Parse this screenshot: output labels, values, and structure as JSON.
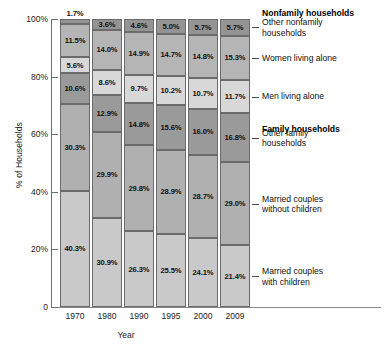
{
  "chart_data": {
    "type": "bar",
    "subtype": "100% stacked column",
    "title": "",
    "xlabel": "Year",
    "ylabel": "% of Households",
    "ylim": [
      0,
      100
    ],
    "ytick_labels": [
      "0",
      "20%",
      "40%",
      "60%",
      "80%",
      "100%"
    ],
    "ytick_values": [
      0,
      20,
      40,
      60,
      80,
      100
    ],
    "grid": false,
    "legend_position": "right-callouts",
    "categories": [
      "1970",
      "1980",
      "1990",
      "1995",
      "2000",
      "2009"
    ],
    "series": [
      {
        "name": "Married couples with children",
        "group": "Family households",
        "color": "#c9c9c9",
        "values": [
          40.3,
          30.9,
          26.3,
          25.5,
          24.1,
          21.4
        ],
        "labels": [
          "40.3%",
          "30.9%",
          "26.3%",
          "25.5%",
          "24.1%",
          "21.4%"
        ]
      },
      {
        "name": "Married couples without children",
        "group": "Family households",
        "color": "#b0b0b0",
        "values": [
          30.3,
          29.9,
          29.8,
          28.9,
          28.7,
          29.0
        ],
        "labels": [
          "30.3%",
          "29.9%",
          "29.8%",
          "28.9%",
          "28.7%",
          "29.0%"
        ]
      },
      {
        "name": "Other family households",
        "group": "Family households",
        "color": "#9a9a9a",
        "values": [
          10.6,
          12.9,
          14.8,
          15.6,
          16.0,
          16.8
        ],
        "labels": [
          "10.6%",
          "12.9%",
          "14.8%",
          "15.6%",
          "16.0%",
          "16.8%"
        ]
      },
      {
        "name": "Men living alone",
        "group": "Nonfamily households",
        "color": "#d8d8d8",
        "values": [
          5.6,
          8.6,
          9.7,
          10.2,
          10.7,
          11.7
        ],
        "labels": [
          "5.6%",
          "8.6%",
          "9.7%",
          "10.2%",
          "10.7%",
          "11.7%"
        ]
      },
      {
        "name": "Women living alone",
        "group": "Nonfamily households",
        "color": "#b5b5b5",
        "values": [
          11.5,
          14.0,
          14.9,
          14.7,
          14.8,
          15.3
        ],
        "labels": [
          "11.5%",
          "14.0%",
          "14.9%",
          "14.7%",
          "14.8%",
          "15.3%"
        ]
      },
      {
        "name": "Other nonfamily households",
        "group": "Nonfamily households",
        "color": "#949494",
        "values": [
          1.7,
          3.6,
          4.6,
          5.0,
          5.7,
          5.7
        ],
        "labels": [
          "1.7%",
          "3.6%",
          "4.6%",
          "5.0%",
          "5.7%",
          "5.7%"
        ]
      }
    ],
    "callouts": [
      {
        "kind": "group-heading",
        "text": "Nonfamily households"
      },
      {
        "kind": "item",
        "text": "Other nonfamily\nhouseholds"
      },
      {
        "kind": "item",
        "text": "Women living alone"
      },
      {
        "kind": "item",
        "text": "Men living alone"
      },
      {
        "kind": "group-heading",
        "text": "Family households"
      },
      {
        "kind": "item",
        "text": "Other family\nhouseholds"
      },
      {
        "kind": "item",
        "text": "Married couples\nwithout children"
      },
      {
        "kind": "item",
        "text": "Married couples\nwith children"
      }
    ]
  }
}
